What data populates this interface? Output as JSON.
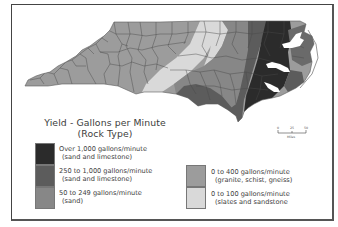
{
  "legend": {
    "title": "Yield - Gallons per Minute",
    "subtitle": "(Rock Type)",
    "items": [
      {
        "range": "Over 1,000 gallons/minute",
        "rock": "(sand and limestone)",
        "color": "#2b2b2b"
      },
      {
        "range": "250 to 1,000 gallons/minute",
        "rock": "(sand and limestone)",
        "color": "#5c5c5c"
      },
      {
        "range": "50 to 249 gallons/minute",
        "rock": "(sand)",
        "color": "#878787"
      },
      {
        "range": "0 to 400 gallons/minute",
        "rock": "(granite, schist, gneiss)",
        "color": "#9c9c9c"
      },
      {
        "range": "0 to 100 gallons/minute",
        "rock": "(slates and sandstone",
        "color": "#d9d9d9"
      }
    ]
  },
  "scale_bar": {
    "ticks": [
      "0",
      "25",
      "50"
    ],
    "unit": "Miles"
  },
  "map": {
    "region": "North Carolina",
    "colors": {
      "mountains": "#9c9c9c",
      "slate_belt": "#d9d9d9",
      "sand": "#878787",
      "sand_limestone_mid": "#5c5c5c",
      "sand_limestone_high": "#2b2b2b",
      "county_lines": "#4a4a4a",
      "water": "#ffffff"
    }
  }
}
